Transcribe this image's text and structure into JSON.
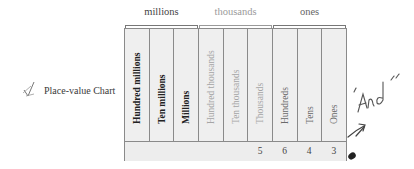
{
  "caption": {
    "mark_icon": "handwritten-check-icon",
    "text": "Place-value Chart"
  },
  "groups": [
    {
      "label": "millions",
      "columns": 3
    },
    {
      "label": "thousands",
      "columns": 3
    },
    {
      "label": "ones",
      "columns": 3
    }
  ],
  "columns": [
    {
      "label": "Hundred millions",
      "group": "millions",
      "value": ""
    },
    {
      "label": "Ten millions",
      "group": "millions",
      "value": ""
    },
    {
      "label": "Millions",
      "group": "millions",
      "value": ""
    },
    {
      "label": "Hundred thousands",
      "group": "thousands",
      "value": ""
    },
    {
      "label": "Ten thousands",
      "group": "thousands",
      "value": ""
    },
    {
      "label": "Thousands",
      "group": "thousands",
      "value": "5"
    },
    {
      "label": "Hundreds",
      "group": "ones",
      "value": "6"
    },
    {
      "label": "Tens",
      "group": "ones",
      "value": "4"
    },
    {
      "label": "Ones",
      "group": "ones",
      "value": "3"
    }
  ],
  "annotation": {
    "text": "\"And\"",
    "arrow_icon": "handwritten-arrow-icon",
    "dot_icon": "ink-dot-icon"
  }
}
